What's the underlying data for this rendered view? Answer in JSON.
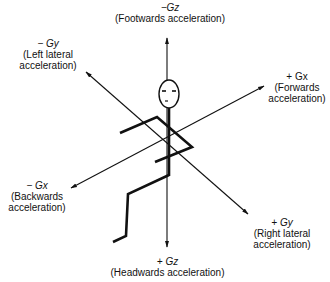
{
  "diagram": {
    "colors": {
      "ink": "#111111",
      "background": "#ffffff"
    },
    "axes": [
      {
        "id": "gz",
        "negative": {
          "symbol": "−Gz",
          "line1": "(Footwards acceleration)",
          "line2": ""
        },
        "positive": {
          "symbol": "+ Gz",
          "line1": "(Headwards acceleration)",
          "line2": ""
        }
      },
      {
        "id": "gy",
        "negative": {
          "symbol": "− Gy",
          "line1": "(Left lateral",
          "line2": "acceleration)"
        },
        "positive": {
          "symbol": "+ Gy",
          "line1": "(Right lateral",
          "line2": "acceleration)"
        }
      },
      {
        "id": "gx",
        "negative": {
          "symbol": "− Gx",
          "line1": "(Backwards",
          "line2": "acceleration)"
        },
        "positive": {
          "symbol": "+ Gx",
          "line1": "(Forwards",
          "line2": "acceleration)"
        }
      }
    ]
  }
}
